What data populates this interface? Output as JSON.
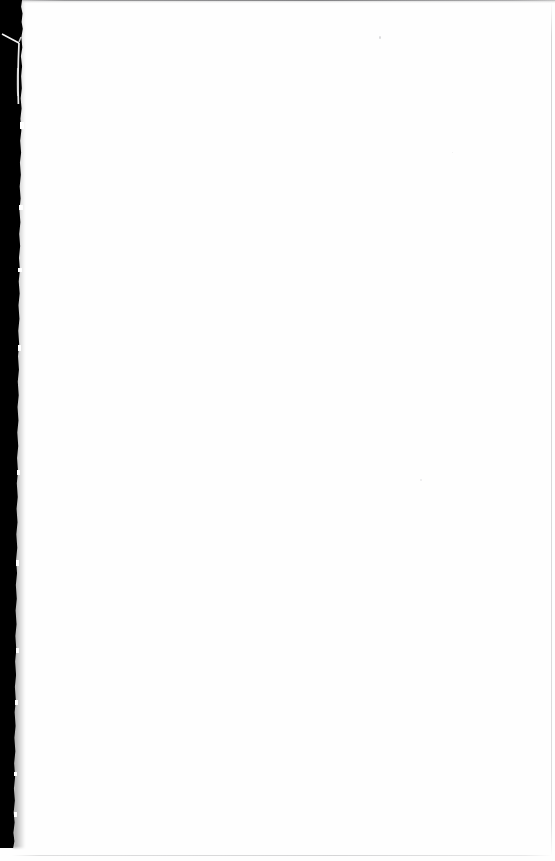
{
  "document": {
    "page_label": "",
    "visible_text": "",
    "body_text": "",
    "note": "blank page"
  },
  "canvas": {
    "width": 555,
    "height": 861,
    "background_color": "#ffffff"
  },
  "artifacts": {
    "gutter_band": {
      "name": "scanner-gutter-band",
      "color": "#000000",
      "edge": "left",
      "top": 0,
      "width_top": 24,
      "width_bottom": 14,
      "height": 848
    },
    "scratch": {
      "name": "scratch-streak",
      "color": "#ffffff",
      "x": 0,
      "y": 28,
      "width": 30,
      "height": 84
    },
    "top_edge_line": {
      "name": "top-edge-shadow",
      "color": "#6e6e70",
      "thickness": 1
    },
    "right_edge_line": {
      "name": "right-edge-rule",
      "color": "#b0b0b2",
      "x": 551,
      "thickness": 1
    },
    "bottom_edge_line": {
      "name": "bottom-edge-rule",
      "color": "#bababc",
      "y": 855,
      "thickness": 1
    },
    "specks": [
      {
        "name": "dust-speck",
        "x": 379,
        "y": 36
      },
      {
        "name": "dust-speck",
        "x": 420,
        "y": 479
      },
      {
        "name": "dust-speck",
        "x": 452,
        "y": 152
      }
    ]
  }
}
